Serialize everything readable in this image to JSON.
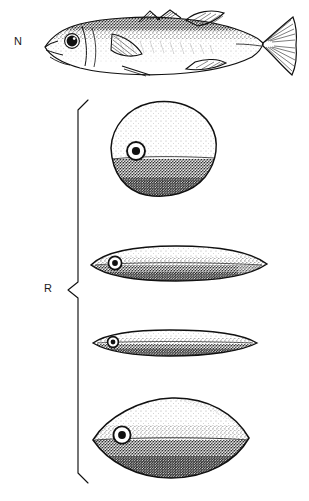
{
  "figure": {
    "type": "scientific-line-illustration",
    "background_color": "#ffffff",
    "ink_color": "#111111",
    "width": 309,
    "height": 501
  },
  "labels": {
    "normal": "N",
    "round": "R"
  },
  "bracket": {
    "name": "round-group-bracket",
    "orientation": "left-curly",
    "top_y": 100,
    "bottom_y": 483,
    "notch_y": 290,
    "spine_x": 77,
    "tip_x": 88
  },
  "specimens": [
    {
      "id": "normal-fish",
      "group": "N",
      "label": "N",
      "shape": "normal fusiform stickleback, lateral view, head left",
      "features": [
        "two dorsal fins",
        "pectoral fin",
        "pelvic spine",
        "anal fin",
        "forked caudal fin",
        "stippled dorsal shading",
        "ringed eye"
      ],
      "bbox": [
        38,
        12,
        300,
        84
      ]
    },
    {
      "id": "round-form-1",
      "group": "R",
      "shape": "rounded diamond / disc body, head left",
      "features": [
        "stippled dark ventral half",
        "ringed eye",
        "no fins drawn"
      ],
      "bbox": [
        107,
        101,
        216,
        196
      ]
    },
    {
      "id": "round-form-2",
      "group": "R",
      "shape": "elongate lenticular body, head left",
      "features": [
        "stippled dark ventral half",
        "ringed eye",
        "no fins drawn"
      ],
      "bbox": [
        90,
        245,
        269,
        282
      ]
    },
    {
      "id": "round-form-3",
      "group": "R",
      "shape": "slender elongate lenticular body, head left",
      "features": [
        "stippled dark ventral half",
        "ringed eye",
        "no fins drawn"
      ],
      "bbox": [
        92,
        329,
        259,
        356
      ]
    },
    {
      "id": "round-form-4",
      "group": "R",
      "shape": "broad almond / lens body with straight midline, head left",
      "features": [
        "dark stippled ventral half",
        "light dorsal half",
        "ringed eye",
        "no fins drawn"
      ],
      "bbox": [
        92,
        397,
        251,
        479
      ]
    }
  ]
}
